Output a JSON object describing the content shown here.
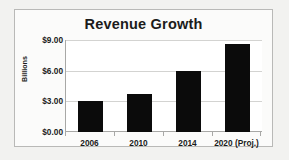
{
  "chart_data": {
    "type": "bar",
    "title": "Revenue Growth",
    "xlabel": "",
    "ylabel": "Billions",
    "categories": [
      "2006",
      "2010",
      "2014",
      "2020 (Proj.)"
    ],
    "values": [
      3.1,
      3.8,
      6.0,
      8.7
    ],
    "series": [
      {
        "name": "Revenue",
        "values": [
          3.1,
          3.8,
          6.0,
          8.7
        ],
        "color": "#0b0b0b"
      }
    ],
    "ylim": [
      0,
      9
    ],
    "ytick_values": [
      9,
      6,
      3,
      0
    ],
    "ytick_labels": [
      "$9.00",
      "$6.00",
      "$3.00",
      "$0.00"
    ],
    "grid": true,
    "grid_axis": "y",
    "legend": false,
    "legend_position": "none",
    "bar_color": "#0b0b0b",
    "plot_background": "#ffffff",
    "frame_background": "#fbfbfa",
    "frame_border_color": "#b9b9b7",
    "gridline_color": "#d3d3d1",
    "axis_line_color": "#a8a8a6",
    "text_color": "#1b1b1b",
    "page_background": "#f2f2f0"
  }
}
